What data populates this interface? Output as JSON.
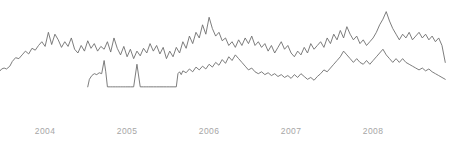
{
  "chart_data": {
    "type": "line",
    "title": "",
    "subtitle": "",
    "xlabel": "",
    "ylabel": "",
    "grid": false,
    "legend": "none",
    "axis_line": false,
    "xlim": [
      2003.45,
      2008.95
    ],
    "ylim": [
      0,
      100
    ],
    "tick_labels": [
      "2004",
      "2005",
      "2006",
      "2007",
      "2008"
    ],
    "tick_values": [
      2004,
      2005,
      2006,
      2007,
      2008
    ],
    "line_color": "#6e6e6e",
    "tick_label_color": "#a6a6a6",
    "background_color": "#ffffff",
    "series": [
      {
        "name": "upper-series",
        "color": "#6e6e6e",
        "x": [
          2003.45,
          2003.47,
          2003.5,
          2003.53,
          2003.57,
          2003.6,
          2003.64,
          2003.68,
          2003.72,
          2003.76,
          2003.8,
          2003.84,
          2003.88,
          2003.92,
          2003.96,
          2004.0,
          2004.04,
          2004.08,
          2004.12,
          2004.16,
          2004.2,
          2004.24,
          2004.28,
          2004.32,
          2004.36,
          2004.4,
          2004.44,
          2004.48,
          2004.52,
          2004.56,
          2004.6,
          2004.64,
          2004.68,
          2004.72,
          2004.76,
          2004.8,
          2004.84,
          2004.88,
          2004.92,
          2004.96,
          2005.0,
          2005.04,
          2005.08,
          2005.12,
          2005.16,
          2005.2,
          2005.24,
          2005.28,
          2005.32,
          2005.36,
          2005.4,
          2005.44,
          2005.48,
          2005.52,
          2005.56,
          2005.6,
          2005.64,
          2005.68,
          2005.72,
          2005.76,
          2005.8,
          2005.84,
          2005.88,
          2005.92,
          2005.96,
          2006.0,
          2006.04,
          2006.08,
          2006.12,
          2006.16,
          2006.2,
          2006.24,
          2006.28,
          2006.32,
          2006.36,
          2006.4,
          2006.44,
          2006.48,
          2006.52,
          2006.56,
          2006.6,
          2006.64,
          2006.68,
          2006.72,
          2006.76,
          2006.8,
          2006.84,
          2006.88,
          2006.92,
          2006.96,
          2007.0,
          2007.04,
          2007.08,
          2007.12,
          2007.16,
          2007.2,
          2007.24,
          2007.28,
          2007.32,
          2007.36,
          2007.4,
          2007.44,
          2007.48,
          2007.52,
          2007.56,
          2007.6,
          2007.64,
          2007.68,
          2007.72,
          2007.76,
          2007.8,
          2007.84,
          2007.88,
          2007.92,
          2007.96,
          2008.0,
          2008.04,
          2008.08,
          2008.12,
          2008.16,
          2008.2,
          2008.24,
          2008.28,
          2008.32,
          2008.36,
          2008.4,
          2008.44,
          2008.48,
          2008.52,
          2008.56,
          2008.6,
          2008.64,
          2008.68,
          2008.72,
          2008.76,
          2008.8,
          2008.84,
          2008.88
        ],
        "values": [
          31,
          33,
          34,
          33,
          36,
          41,
          45,
          44,
          48,
          52,
          49,
          55,
          53,
          58,
          62,
          57,
          72,
          59,
          70,
          64,
          56,
          62,
          57,
          66,
          54,
          50,
          58,
          52,
          63,
          55,
          60,
          52,
          57,
          54,
          62,
          51,
          66,
          55,
          48,
          57,
          46,
          54,
          44,
          52,
          47,
          55,
          50,
          60,
          52,
          58,
          49,
          56,
          44,
          52,
          46,
          56,
          50,
          62,
          55,
          68,
          60,
          72,
          66,
          80,
          70,
          88,
          76,
          68,
          72,
          63,
          66,
          58,
          62,
          56,
          64,
          58,
          66,
          60,
          68,
          58,
          62,
          56,
          60,
          52,
          58,
          50,
          56,
          62,
          54,
          58,
          50,
          46,
          52,
          48,
          56,
          50,
          60,
          54,
          58,
          62,
          56,
          66,
          60,
          70,
          64,
          74,
          66,
          78,
          70,
          64,
          68,
          60,
          64,
          58,
          62,
          66,
          72,
          80,
          86,
          94,
          84,
          76,
          70,
          64,
          70,
          66,
          72,
          64,
          68,
          72,
          66,
          70,
          64,
          68,
          62,
          66,
          58,
          40
        ]
      },
      {
        "name": "lower-series",
        "color": "#6e6e6e",
        "x": [
          2004.52,
          2004.54,
          2004.57,
          2004.6,
          2004.63,
          2004.66,
          2004.69,
          2004.72,
          2004.74,
          2004.76,
          2004.78,
          2004.8,
          2004.82,
          2004.84,
          2004.86,
          2004.88,
          2004.9,
          2004.92,
          2004.94,
          2004.96,
          2004.98,
          2005.0,
          2005.04,
          2005.08,
          2005.12,
          2005.16,
          2005.2,
          2005.22,
          2005.24,
          2005.26,
          2005.28,
          2005.32,
          2005.36,
          2005.4,
          2005.44,
          2005.48,
          2005.52,
          2005.56,
          2005.6,
          2005.62,
          2005.64,
          2005.66,
          2005.68,
          2005.72,
          2005.76,
          2005.8,
          2005.84,
          2005.88,
          2005.92,
          2005.96,
          2006.0,
          2006.04,
          2006.08,
          2006.12,
          2006.16,
          2006.2,
          2006.24,
          2006.28,
          2006.32,
          2006.36,
          2006.4,
          2006.44,
          2006.48,
          2006.52,
          2006.56,
          2006.6,
          2006.64,
          2006.68,
          2006.72,
          2006.76,
          2006.8,
          2006.84,
          2006.88,
          2006.92,
          2006.96,
          2007.0,
          2007.04,
          2007.08,
          2007.12,
          2007.16,
          2007.2,
          2007.24,
          2007.28,
          2007.32,
          2007.36,
          2007.4,
          2007.44,
          2007.48,
          2007.52,
          2007.56,
          2007.6,
          2007.64,
          2007.68,
          2007.72,
          2007.76,
          2007.8,
          2007.84,
          2007.88,
          2007.92,
          2007.96,
          2008.0,
          2008.04,
          2008.08,
          2008.12,
          2008.16,
          2008.2,
          2008.24,
          2008.28,
          2008.32,
          2008.36,
          2008.4,
          2008.44,
          2008.48,
          2008.52,
          2008.56,
          2008.6,
          2008.64,
          2008.68,
          2008.72,
          2008.76,
          2008.8,
          2008.84,
          2008.88
        ],
        "values": [
          14,
          22,
          26,
          28,
          27,
          29,
          28,
          42,
          30,
          14,
          14,
          14,
          14,
          14,
          14,
          14,
          14,
          14,
          14,
          14,
          14,
          14,
          14,
          14,
          38,
          14,
          14,
          14,
          14,
          14,
          14,
          14,
          14,
          14,
          14,
          14,
          14,
          14,
          14,
          28,
          30,
          27,
          31,
          29,
          33,
          30,
          35,
          32,
          36,
          33,
          38,
          35,
          40,
          37,
          43,
          39,
          46,
          42,
          48,
          44,
          40,
          36,
          32,
          34,
          30,
          28,
          30,
          27,
          29,
          26,
          28,
          25,
          27,
          24,
          26,
          23,
          27,
          24,
          28,
          25,
          22,
          24,
          21,
          25,
          28,
          32,
          30,
          34,
          38,
          42,
          46,
          52,
          48,
          44,
          40,
          44,
          40,
          38,
          42,
          38,
          42,
          46,
          50,
          54,
          48,
          44,
          40,
          44,
          40,
          44,
          40,
          38,
          36,
          34,
          32,
          34,
          31,
          33,
          30,
          28,
          26,
          24,
          22
        ]
      }
    ]
  }
}
